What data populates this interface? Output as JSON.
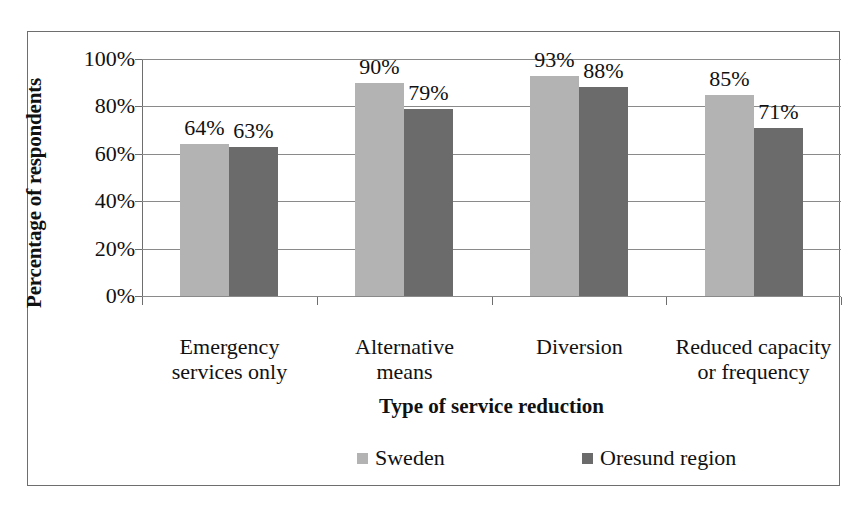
{
  "chart_data": {
    "type": "bar",
    "title": "",
    "xlabel": "Type of service reduction",
    "ylabel": "Percentage of respondents",
    "categories": [
      "Emergency\nservices only",
      "Alternative\nmeans",
      "Diversion",
      "Reduced capacity\nor frequency"
    ],
    "category_lines": [
      [
        "Emergency",
        "services only"
      ],
      [
        "Alternative",
        "means"
      ],
      [
        "Diversion",
        ""
      ],
      [
        "Reduced capacity",
        "or frequency"
      ]
    ],
    "series": [
      {
        "name": "Sweden",
        "color": "#b3b3b3",
        "values": [
          64,
          90,
          93,
          85
        ],
        "labels": [
          "64%",
          "90%",
          "93%",
          "85%"
        ]
      },
      {
        "name": "Oresund region",
        "color": "#6b6b6b",
        "values": [
          63,
          79,
          88,
          71
        ],
        "labels": [
          "63%",
          "79%",
          "88%",
          "71%"
        ]
      }
    ],
    "ylim": [
      0,
      100
    ],
    "yticks": [
      0,
      20,
      40,
      60,
      80,
      100
    ],
    "ytick_labels": [
      "0%",
      "20%",
      "40%",
      "60%",
      "80%",
      "100%"
    ],
    "grid": true,
    "legend_position": "bottom",
    "value_suffix": "%"
  },
  "axis": {
    "y_title": "Percentage of respondents",
    "x_title": "Type of service reduction"
  },
  "legend": {
    "items": [
      {
        "label": "Sweden"
      },
      {
        "label": "Oresund region"
      }
    ]
  },
  "colors": {
    "series_sweden": "#b3b3b3",
    "series_oresund": "#6b6b6b",
    "gridline": "#8a8a8a",
    "frame": "#6e6e6e",
    "text": "#111111"
  }
}
